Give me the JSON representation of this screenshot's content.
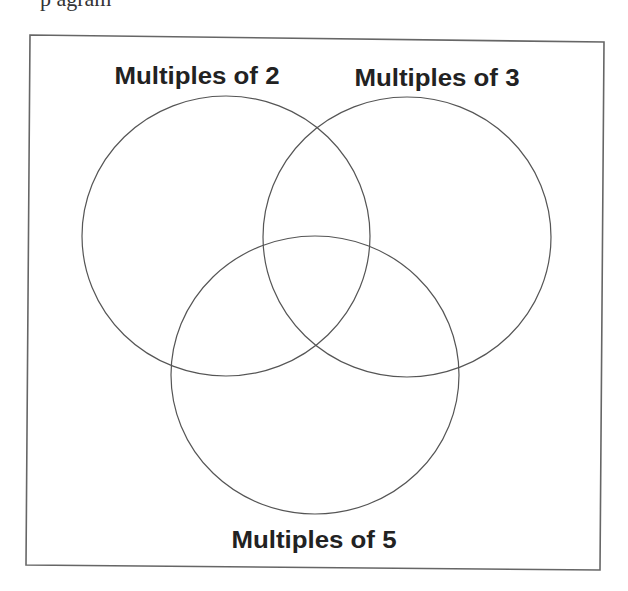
{
  "header": {
    "cut_text": "p                     agram"
  },
  "diagram": {
    "type": "venn",
    "sets": [
      {
        "id": "A",
        "label": "Multiples of 2"
      },
      {
        "id": "B",
        "label": "Multiples of 3"
      },
      {
        "id": "C",
        "label": "Multiples of 5"
      }
    ],
    "colors": {
      "stroke": "#555555",
      "frame": "#666666",
      "background": "#ffffff",
      "text": "#222222"
    }
  }
}
